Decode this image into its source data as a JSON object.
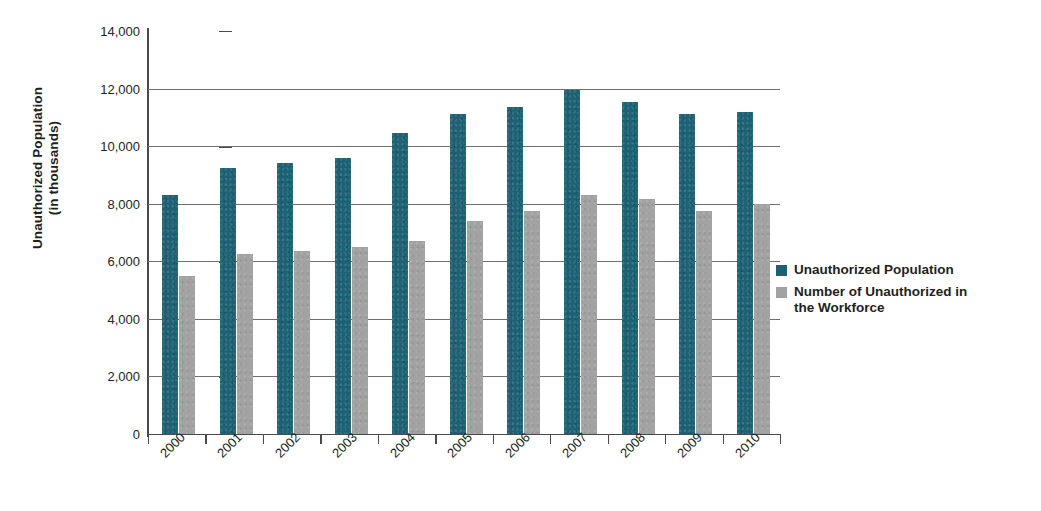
{
  "chart_data": {
    "type": "bar",
    "title": "",
    "xlabel": "",
    "ylabel": "Unauthorized Population\n(in thousands)",
    "ylim": [
      0,
      14000
    ],
    "ytick_step": 2000,
    "ytick_labels": [
      "0",
      "2,000",
      "4,000",
      "6,000",
      "8,000",
      "10,000",
      "12,000",
      "14,000"
    ],
    "ytick_values": [
      0,
      2000,
      4000,
      6000,
      8000,
      10000,
      12000,
      14000
    ],
    "grid": "horizontal",
    "legend_position": "right",
    "categories": [
      "2000",
      "2001",
      "2002",
      "2003",
      "2004",
      "2005",
      "2006",
      "2007",
      "2008",
      "2009",
      "2010"
    ],
    "series": [
      {
        "name": "Unauthorized Population",
        "color": "#1d6274",
        "values": [
          8300,
          9250,
          9400,
          9600,
          10450,
          11100,
          11350,
          11950,
          11550,
          11100,
          11200
        ]
      },
      {
        "name": "Number of Unauthorized in\nthe Workforce",
        "color": "#a2a2a2",
        "values": [
          5500,
          6250,
          6350,
          6500,
          6700,
          7400,
          7750,
          8300,
          8150,
          7750,
          8000
        ]
      }
    ]
  },
  "legend": {
    "items": [
      {
        "label": "Unauthorized Population",
        "swatch": "legend-swatch-unauthorized-population"
      },
      {
        "label": "Number of Unauthorized in\nthe Workforce",
        "swatch": "legend-swatch-workforce"
      }
    ]
  }
}
